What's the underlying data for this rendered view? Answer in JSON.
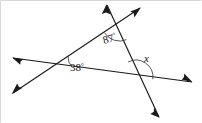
{
  "figure": {
    "kind": "geometry-angle-diagram",
    "width": 202,
    "height": 123,
    "background_color": "#ffffff",
    "stroke_color": "#1a1a1a",
    "arc_color": "#3a3a3a",
    "frame_color": "#d8d8d8"
  },
  "labels": {
    "angle_top": "87",
    "angle_top_degree": "°",
    "angle_left": "38",
    "angle_left_degree": "°",
    "angle_right": "x"
  },
  "geometry": {
    "vertices": {
      "left": {
        "x": 56,
        "y": 65
      },
      "top": {
        "x": 119,
        "y": 23
      },
      "right": {
        "x": 136,
        "y": 77
      }
    },
    "lines": [
      {
        "name": "line-left-to-top",
        "from": {
          "x": 13,
          "y": 93
        },
        "to": {
          "x": 140,
          "y": 8
        },
        "arrows": [
          "start",
          "end"
        ]
      },
      {
        "name": "line-left-to-right",
        "from": {
          "x": 13,
          "y": 58
        },
        "to": {
          "x": 192,
          "y": 82
        },
        "arrows": [
          "start",
          "end"
        ]
      },
      {
        "name": "line-top-to-right",
        "from": {
          "x": 107,
          "y": 5
        },
        "to": {
          "x": 159,
          "y": 117
        },
        "arrows": [
          "start",
          "end"
        ]
      }
    ],
    "arrow_endpoints": [
      {
        "name": "arrow-upper-left-top",
        "x": 107,
        "y": 5
      },
      {
        "name": "arrow-upper-right-top",
        "x": 140,
        "y": 8
      },
      {
        "name": "arrow-left-upper",
        "x": 13,
        "y": 58
      },
      {
        "name": "arrow-left-lower",
        "x": 13,
        "y": 93
      },
      {
        "name": "arrow-right",
        "x": 192,
        "y": 82
      },
      {
        "name": "arrow-bottom-right",
        "x": 159,
        "y": 117
      }
    ],
    "arcs": [
      {
        "name": "arc-87",
        "at_vertex": "top",
        "radius": 18
      },
      {
        "name": "arc-38",
        "at_vertex": "left",
        "radius": 16
      },
      {
        "name": "arc-x",
        "at_vertex": "right",
        "radius": 17
      }
    ]
  }
}
